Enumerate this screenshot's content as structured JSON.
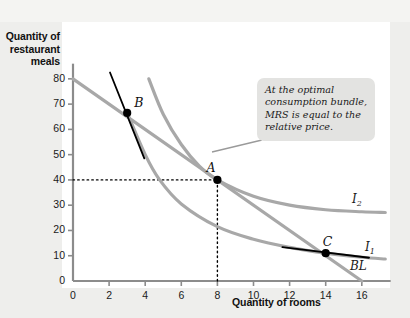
{
  "chart_data": {
    "type": "line",
    "title": "",
    "xlabel": "Quantity of rooms",
    "ylabel": "Quantity of restaurant meals",
    "xlim": [
      0,
      17.6
    ],
    "ylim": [
      0,
      86
    ],
    "xticks": [
      0,
      2,
      4,
      6,
      8,
      10,
      12,
      14,
      16
    ],
    "yticks": [
      0,
      10,
      20,
      30,
      40,
      50,
      60,
      70,
      80
    ],
    "grid": false,
    "legend": "inline-curve-labels",
    "series": [
      {
        "name": "BL",
        "label": "BL",
        "type": "budget-line",
        "color": "#a8a8a8",
        "points": [
          [
            0,
            80
          ],
          [
            16,
            0
          ]
        ]
      },
      {
        "name": "I1",
        "label": "I₁",
        "type": "indifference-curve",
        "color": "#a8a8a8",
        "points": [
          [
            3.0,
            66.5
          ],
          [
            4.0,
            50.0
          ],
          [
            4.8,
            40.0
          ],
          [
            6.0,
            30.5
          ],
          [
            8.0,
            21.5
          ],
          [
            10.0,
            16.5
          ],
          [
            12.0,
            13.3
          ],
          [
            14.0,
            11.0
          ],
          [
            16.0,
            9.4
          ],
          [
            17.3,
            8.7
          ]
        ]
      },
      {
        "name": "I2",
        "label": "I₂",
        "type": "indifference-curve",
        "color": "#a8a8a8",
        "points": [
          [
            4.2,
            80.0
          ],
          [
            5.0,
            66.0
          ],
          [
            6.0,
            54.0
          ],
          [
            7.0,
            45.5
          ],
          [
            8.0,
            40.0
          ],
          [
            10.0,
            33.5
          ],
          [
            12.0,
            30.0
          ],
          [
            14.0,
            28.2
          ],
          [
            16.0,
            27.4
          ],
          [
            17.3,
            27.1
          ]
        ]
      }
    ],
    "points": [
      {
        "name": "A",
        "label": "A",
        "x": 8,
        "y": 40,
        "label_dx": -11,
        "label_dy": -20
      },
      {
        "name": "B",
        "label": "B",
        "x": 3,
        "y": 66.5,
        "label_dx": 7,
        "label_dy": -18
      },
      {
        "name": "C",
        "label": "C",
        "x": 14,
        "y": 11,
        "label_dx": -3,
        "label_dy": -19
      }
    ],
    "tangent_lines": [
      {
        "at_point": "B",
        "from": [
          2.05,
          82.5
        ],
        "to": [
          3.95,
          48.5
        ],
        "color": "#000000"
      },
      {
        "at_point": "C",
        "from": [
          11.6,
          13.4
        ],
        "to": [
          16.4,
          9.2
        ],
        "color": "#000000"
      }
    ],
    "guide_lines": [
      {
        "name": "horizontal-guide-at-40",
        "style": "dotted",
        "from": [
          0,
          40
        ],
        "to": [
          8,
          40
        ]
      },
      {
        "name": "vertical-guide-at-8",
        "style": "dotted",
        "from": [
          8,
          0
        ],
        "to": [
          8,
          40
        ]
      }
    ],
    "annotations": [
      {
        "name": "optimal-bundle-callout",
        "text": "At the optimal consumption bundle, MRS is equal to the relative price.",
        "points_to": "A"
      }
    ]
  },
  "axis": {
    "y_title": "Quantity of restaurant meals",
    "x_title": "Quantity of rooms",
    "y_tick_labels": [
      "80",
      "70",
      "60",
      "50",
      "40",
      "30",
      "20",
      "10",
      "0"
    ],
    "x_tick_labels": [
      "0",
      "2",
      "4",
      "6",
      "8",
      "10",
      "12",
      "14",
      "16"
    ]
  },
  "labels": {
    "curve_i1": "I",
    "curve_i1_sub": "1",
    "curve_i2": "I",
    "curve_i2_sub": "2",
    "curve_bl": "BL",
    "point_a": "A",
    "point_b": "B",
    "point_c": "C"
  },
  "callout": {
    "text": "At the optimal consumption bundle, MRS is equal to the relative price."
  },
  "colors": {
    "curve": "#a8a8a8",
    "tangent": "#000000",
    "axis": "#8c8c8c",
    "point": "#000000",
    "panel": "#ffffff",
    "background": "#eeeeec",
    "callout_bg": "#e3e3e1"
  }
}
